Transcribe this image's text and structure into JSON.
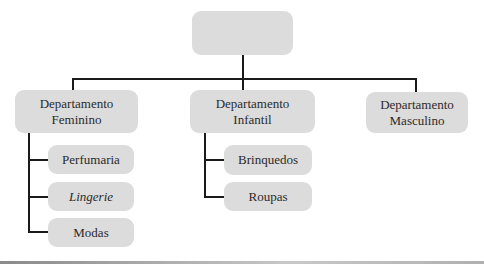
{
  "diagram": {
    "type": "org-chart",
    "root": {
      "label": ""
    },
    "departments": [
      {
        "label_line1": "Departamento",
        "label_line2": "Feminino",
        "children": [
          {
            "label": "Perfumaria",
            "italic": false
          },
          {
            "label": "Lingerie",
            "italic": true
          },
          {
            "label": "Modas",
            "italic": false
          }
        ]
      },
      {
        "label_line1": "Departamento",
        "label_line2": "Infantil",
        "children": [
          {
            "label": "Brinquedos",
            "italic": false
          },
          {
            "label": "Roupas",
            "italic": false
          }
        ]
      },
      {
        "label_line1": "Departamento",
        "label_line2": "Masculino",
        "children": []
      }
    ],
    "colors": {
      "box_fill": "#dcdcdc",
      "connector": "#1a1a1a",
      "background": "#ffffff"
    }
  }
}
